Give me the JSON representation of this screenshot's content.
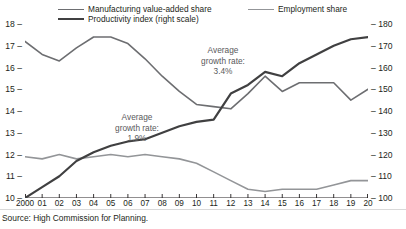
{
  "legend": {
    "items": [
      {
        "label": "Manufacturing value-added share",
        "color": "#6d6e71",
        "width": 1.6,
        "key": "mva"
      },
      {
        "label": "Productivity index (right scale)",
        "color": "#404041",
        "width": 2.2,
        "key": "prod"
      },
      {
        "label": "Employment share",
        "color": "#939598",
        "width": 1.6,
        "key": "emp"
      }
    ]
  },
  "annotations": [
    {
      "line1": "Average",
      "line2": "growth rate:",
      "line3": "1.9%"
    },
    {
      "line1": "Average",
      "line2": "growth rate:",
      "line3": "3.4%"
    }
  ],
  "source": "Source: High Commission for Planning.",
  "chart_data": {
    "type": "line",
    "title": "",
    "xlabel": "",
    "ylabel": "",
    "grid": false,
    "legend_position": "top",
    "x": [
      "2000",
      "01",
      "02",
      "03",
      "04",
      "05",
      "06",
      "07",
      "08",
      "09",
      "10",
      "11",
      "12",
      "13",
      "14",
      "15",
      "16",
      "17",
      "18",
      "19",
      "20"
    ],
    "xticklabels": [
      "2000",
      "01",
      "02",
      "03",
      "04",
      "05",
      "06",
      "07",
      "08",
      "09",
      "10",
      "11",
      "12",
      "13",
      "14",
      "15",
      "16",
      "17",
      "18",
      "19",
      "20"
    ],
    "left_axis": {
      "ylim": [
        10,
        18
      ],
      "ticks": [
        10,
        11,
        12,
        13,
        14,
        15,
        16,
        17,
        18
      ],
      "ticklabels": [
        "10",
        "11",
        "12",
        "13",
        "14",
        "15",
        "16",
        "17",
        "18"
      ]
    },
    "right_axis": {
      "ylim": [
        100,
        180
      ],
      "ticks": [
        100,
        110,
        120,
        130,
        140,
        150,
        160,
        170,
        180
      ],
      "ticklabels": [
        "100",
        "110",
        "120",
        "130",
        "140",
        "150",
        "160",
        "170",
        "180"
      ]
    },
    "series": [
      {
        "name": "Manufacturing value-added share",
        "axis": "left",
        "color": "#6d6e71",
        "width": 1.6,
        "values": [
          17.2,
          16.6,
          16.3,
          16.9,
          17.4,
          17.4,
          17.1,
          16.4,
          15.6,
          14.9,
          14.3,
          14.2,
          14.1,
          14.8,
          15.6,
          14.9,
          15.3,
          15.3,
          15.3,
          14.5,
          15.0
        ]
      },
      {
        "name": "Employment share",
        "axis": "left",
        "color": "#939598",
        "width": 1.6,
        "values": [
          11.9,
          11.8,
          12.0,
          11.8,
          11.9,
          12.0,
          11.9,
          12.0,
          11.9,
          11.8,
          11.6,
          11.2,
          10.8,
          10.4,
          10.3,
          10.4,
          10.4,
          10.4,
          10.6,
          10.8,
          10.8
        ]
      },
      {
        "name": "Productivity index",
        "axis": "right",
        "color": "#404041",
        "width": 2.2,
        "values": [
          100.0,
          105.0,
          110.0,
          117.0,
          121.0,
          124.0,
          126.0,
          127.0,
          130.0,
          133.0,
          135.0,
          136.0,
          148.0,
          152.0,
          158.0,
          156.0,
          162.0,
          166.0,
          170.0,
          173.0,
          174.0
        ]
      }
    ]
  }
}
